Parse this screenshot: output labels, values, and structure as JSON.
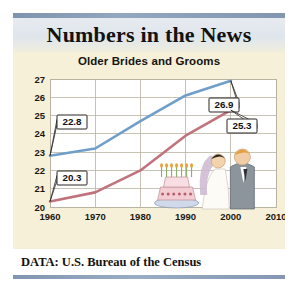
{
  "card": {
    "title": "Numbers in the News",
    "subtitle": "Older Brides and Grooms",
    "footer_label": "DATA: U.S. Bureau of the Census"
  },
  "colors": {
    "background": "#f7f0d8",
    "groom_line": "#6f9ecb",
    "bride_line": "#c0737c",
    "banner_rule": "#8396b0",
    "grid": "#b9b4a2",
    "axis_text": "#1a1813",
    "callout_bg": "#ffffff",
    "callout_border": "#2a2722"
  },
  "chart_data": {
    "type": "line",
    "title": "Older Brides and Grooms",
    "xlabel": "",
    "ylabel": "",
    "xlim": [
      1960,
      2010
    ],
    "ylim": [
      20,
      27
    ],
    "grid": true,
    "legend": "none",
    "x": [
      1960,
      1970,
      1980,
      1990,
      2000
    ],
    "xticks": [
      "1960",
      "1970",
      "1980",
      "1990",
      "2000",
      "2010"
    ],
    "yticks": [
      "20",
      "21",
      "22",
      "23",
      "24",
      "25",
      "26",
      "27"
    ],
    "series": [
      {
        "name": "Grooms",
        "color": "#6f9ecb",
        "values": [
          22.8,
          23.2,
          24.7,
          26.1,
          26.9
        ]
      },
      {
        "name": "Brides",
        "color": "#c0737c",
        "values": [
          20.3,
          20.8,
          22.0,
          23.9,
          25.3
        ]
      }
    ],
    "annotations": [
      {
        "label": "22.8",
        "series": "Grooms",
        "x": 1960,
        "y": 22.8
      },
      {
        "label": "20.3",
        "series": "Brides",
        "x": 1960,
        "y": 20.3
      },
      {
        "label": "26.9",
        "series": "Grooms",
        "x": 2000,
        "y": 26.9
      },
      {
        "label": "25.3",
        "series": "Brides",
        "x": 2000,
        "y": 25.3
      }
    ],
    "illustration": "bride-and-groom-with-wedding-cake"
  }
}
